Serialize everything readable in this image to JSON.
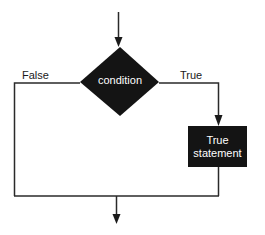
{
  "diagram": {
    "type": "flowchart",
    "decision": {
      "label": "condition"
    },
    "process": {
      "line1": "True",
      "line2": "statement"
    },
    "edges": {
      "false_label": "False",
      "true_label": "True"
    },
    "colors": {
      "shape_fill": "#141414",
      "shape_text": "#ffffff",
      "line": "#2a2a2a",
      "background": "#ffffff"
    }
  }
}
